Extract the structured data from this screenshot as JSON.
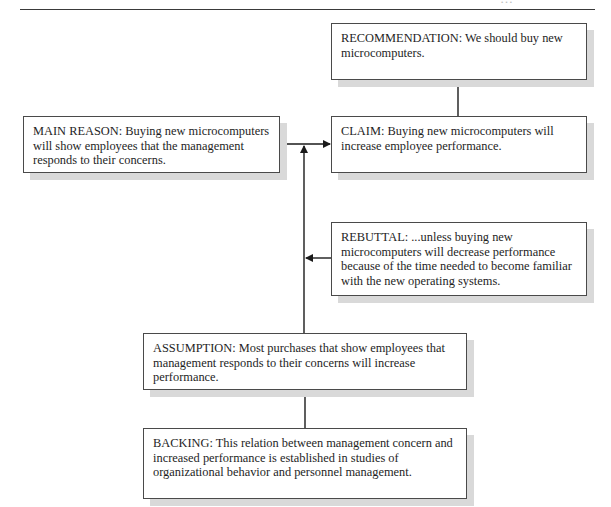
{
  "page": {
    "header_fragment": "…",
    "colors": {
      "line": "#1a1a1a",
      "box_border": "#4a4a4a",
      "shadow": "#d9d9d9",
      "background": "#ffffff"
    }
  },
  "diagram": {
    "type": "toulmin-argument",
    "nodes": {
      "recommendation": {
        "label": "RECOMMENDATION:",
        "text": "We should buy new microcomputers."
      },
      "main_reason": {
        "label": "MAIN REASON:",
        "text": "Buying new microcomputers will show employees that the management responds to their concerns."
      },
      "claim": {
        "label": "CLAIM:",
        "text": "Buying new microcomputers will increase employee performance."
      },
      "rebuttal": {
        "label": "REBUTTAL:",
        "text": "...unless buying new microcomputers will decrease performance because of the time needed to become familiar with the new operating systems."
      },
      "assumption": {
        "label": "ASSUMPTION:",
        "text": "Most purchases that show employees that management responds to their concerns will increase performance."
      },
      "backing": {
        "label": "BACKING:",
        "text": "This relation between management concern and increased performance is established in studies of organizational behavior and personnel management."
      }
    },
    "edges": [
      {
        "from": "claim",
        "to": "recommendation"
      },
      {
        "from": "main_reason",
        "to": "claim"
      },
      {
        "from": "assumption",
        "to": "main_reason-claim link"
      },
      {
        "from": "rebuttal",
        "to": "assumption link"
      },
      {
        "from": "backing",
        "to": "assumption"
      }
    ]
  }
}
